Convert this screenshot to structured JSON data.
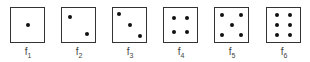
{
  "faces": [
    {
      "label": "f",
      "sub": "1",
      "x": 10,
      "dots": [
        [
          50,
          50
        ]
      ]
    },
    {
      "label": "f",
      "sub": "2",
      "x": 61,
      "dots": [
        [
          25,
          25
        ],
        [
          75,
          75
        ]
      ]
    },
    {
      "label": "f",
      "sub": "3",
      "x": 112,
      "dots": [
        [
          18,
          18
        ],
        [
          50,
          50
        ],
        [
          82,
          82
        ]
      ]
    },
    {
      "label": "f",
      "sub": "4",
      "x": 163,
      "dots": [
        [
          30,
          30
        ],
        [
          70,
          30
        ],
        [
          30,
          72
        ],
        [
          70,
          72
        ]
      ]
    },
    {
      "label": "f",
      "sub": "5",
      "x": 214,
      "dots": [
        [
          22,
          22
        ],
        [
          78,
          22
        ],
        [
          50,
          50
        ],
        [
          22,
          78
        ],
        [
          78,
          78
        ]
      ]
    },
    {
      "label": "f",
      "sub": "6",
      "x": 266,
      "dots": [
        [
          30,
          22
        ],
        [
          70,
          22
        ],
        [
          30,
          50
        ],
        [
          70,
          50
        ],
        [
          30,
          78
        ],
        [
          70,
          78
        ]
      ]
    }
  ]
}
